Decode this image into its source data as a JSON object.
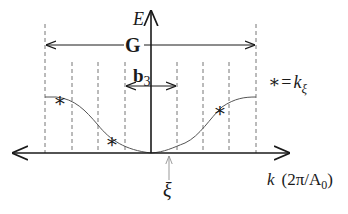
{
  "diagram": {
    "type": "band-structure-sketch",
    "axes": {
      "vertical_label": "E",
      "horizontal_label_var": "k",
      "horizontal_label_units": "(2π/A",
      "horizontal_label_sub": "0",
      "horizontal_label_close": ")"
    },
    "vectors": {
      "G_label": "G",
      "b3_label": "b",
      "b3_sub": "3"
    },
    "marker": {
      "xi_label": "ξ"
    },
    "legend": {
      "star": "∗",
      "equals": "=",
      "k": "k",
      "sub": "ξ"
    },
    "stars": [
      {
        "x": 60,
        "y": 99
      },
      {
        "x": 112,
        "y": 140
      },
      {
        "x": 220,
        "y": 109
      }
    ],
    "dashed_lines_x": [
      45,
      72,
      98,
      125,
      177,
      203,
      229,
      256
    ],
    "colors": {
      "axis": "#1a1a1a",
      "curve": "#555555",
      "dashed": "#777777",
      "xi_arrow": "#999999"
    }
  }
}
